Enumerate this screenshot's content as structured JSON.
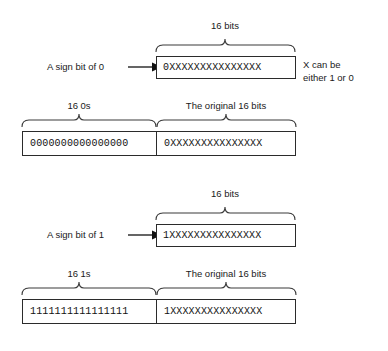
{
  "figure": {
    "title": "",
    "background": "#ffffff",
    "line_color": "#2b2b2b",
    "text_color": "#1a1a1a"
  },
  "diagram_positive": {
    "top_brace_label": "16 bits",
    "sign_label": "A sign bit of 0",
    "sign_bit_value": "0",
    "source_bits": "0XXXXXXXXXXXXXXX",
    "note_line1": "X can be",
    "note_line2": "either 1 or 0",
    "left_brace_label": "16 0s",
    "right_brace_label": "The original 16 bits",
    "extension_bits": "0000000000000000",
    "result_bits": "0XXXXXXXXXXXXXXX"
  },
  "diagram_negative": {
    "top_brace_label": "16 bits",
    "sign_label": "A sign bit of 1",
    "sign_bit_value": "1",
    "source_bits": "1XXXXXXXXXXXXXXX",
    "left_brace_label": "16 1s",
    "right_brace_label": "The original 16 bits",
    "extension_bits": "1111111111111111",
    "result_bits": "1XXXXXXXXXXXXXXX"
  }
}
